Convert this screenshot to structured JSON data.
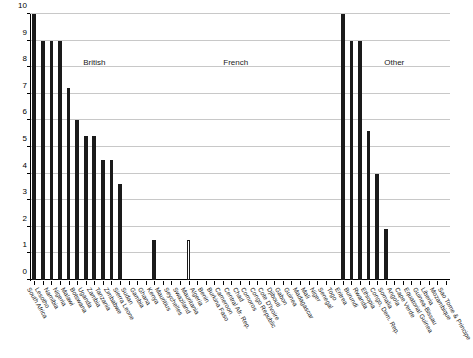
{
  "chart_data": {
    "type": "bar",
    "title": "",
    "subtitle": "",
    "xlabel": "",
    "ylabel": "",
    "ylim": [
      0,
      10
    ],
    "y_ticks": [
      0,
      1,
      2,
      3,
      4,
      5,
      6,
      7,
      8,
      9,
      10
    ],
    "grid": true,
    "legend": "none",
    "bar_color": "#1a1a1a",
    "hollow_bar_color": "#ffffff",
    "hollow_bar_border": "#1a1a1a",
    "grid_color": "#c8c8c8",
    "axis_color": "#000000",
    "categories": [
      "South Africa",
      "Lesotho",
      "Namibia",
      "Nigeria",
      "Malawi",
      "Botswana",
      "Uganda",
      "Zambia",
      "Tanzania",
      "Zimbabwe",
      "Sierra Leone",
      "Sudan",
      "Gambia",
      "Ghana",
      "Kenya",
      "Mauritius",
      "Seychelles",
      "Swaziland",
      "Mauritania",
      "Algeria",
      "Benin",
      "Burkina Faso",
      "Cameroon",
      "Central Afr. Rep.",
      "Chad",
      "Comoros",
      "Congo Republic",
      "Cote D'Ivoire",
      "Djibouti",
      "Gabon",
      "Guinea",
      "Madagascar",
      "Mali",
      "Niger",
      "Senegal",
      "Togo",
      "Eritrea",
      "Burundi",
      "Rwanda",
      "Ethiopia",
      "Congo, Dem. Rep.",
      "Somalia",
      "Angola",
      "Cape Verde",
      "Equatorial Guinea",
      "Guinea-Bissau",
      "Liberia",
      "Mozambique",
      "Sao Tome & Principe"
    ],
    "values": [
      10,
      9,
      9,
      9,
      7.2,
      6,
      5.4,
      5.4,
      4.5,
      4.5,
      3.6,
      0,
      0,
      0,
      1.5,
      0,
      0,
      0,
      1.5,
      0,
      0,
      0,
      0,
      0,
      0,
      0,
      0,
      0,
      0,
      0,
      0,
      0,
      0,
      0,
      0,
      0,
      10,
      9,
      9,
      5.6,
      4,
      1.9,
      0,
      0,
      0,
      0,
      0,
      0,
      0
    ],
    "bar_styles": [
      "filled",
      "filled",
      "filled",
      "filled",
      "filled",
      "filled",
      "filled",
      "filled",
      "filled",
      "filled",
      "filled",
      "filled",
      "filled",
      "filled",
      "filled",
      "filled",
      "filled",
      "filled",
      "hollow",
      "filled",
      "filled",
      "filled",
      "filled",
      "filled",
      "filled",
      "filled",
      "filled",
      "filled",
      "filled",
      "filled",
      "filled",
      "filled",
      "filled",
      "filled",
      "filled",
      "filled",
      "filled",
      "filled",
      "filled",
      "filled",
      "filled",
      "filled",
      "filled",
      "filled",
      "filled",
      "filled",
      "filled",
      "filled",
      "filled"
    ],
    "annotations": [
      {
        "text": "British",
        "x_index": 7.0,
        "y": 8.35
      },
      {
        "text": "French",
        "x_index": 23.5,
        "y": 8.35
      },
      {
        "text": "Other",
        "x_index": 42.0,
        "y": 8.35
      }
    ]
  }
}
